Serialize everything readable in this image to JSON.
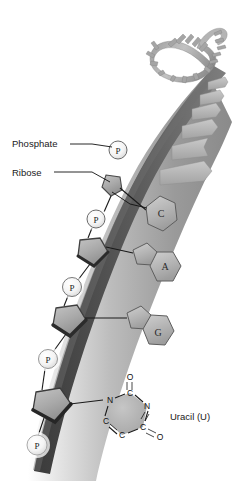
{
  "figure": {
    "background_color": "#ffffff"
  },
  "labels": {
    "phosphate": "Phosphate",
    "ribose": "Ribose",
    "uracil": "Uracil (U)"
  },
  "phosphate_markers": [
    {
      "text": "P",
      "cx": 118,
      "cy": 150,
      "r": 10.5
    },
    {
      "text": "P",
      "cx": 96,
      "cy": 219,
      "r": 10.5
    },
    {
      "text": "P",
      "cx": 72,
      "cy": 287,
      "r": 10.5
    },
    {
      "text": "P",
      "cx": 48,
      "cy": 359,
      "r": 10.5
    },
    {
      "text": "P",
      "cx": 37,
      "cy": 445,
      "r": 10.5
    }
  ],
  "bases": [
    {
      "label": "C",
      "name": "cytosine",
      "shape": "hexagon",
      "cx": 160,
      "cy": 213
    },
    {
      "label": "A",
      "name": "adenine",
      "shape": "purine",
      "cx": 163,
      "cy": 270
    },
    {
      "label": "G",
      "name": "guanine",
      "shape": "purine",
      "cx": 157,
      "cy": 336
    },
    {
      "label": "U",
      "name": "uracil",
      "shape": "pyrimidine-atoms",
      "cx": 131,
      "cy": 412
    }
  ],
  "uracil_atoms": [
    {
      "symbol": "N",
      "x": 110,
      "y": 400
    },
    {
      "symbol": "C",
      "x": 130,
      "y": 393
    },
    {
      "symbol": "N",
      "x": 147,
      "y": 406
    },
    {
      "symbol": "C",
      "x": 143,
      "y": 427
    },
    {
      "symbol": "C",
      "x": 122,
      "y": 435
    },
    {
      "symbol": "C",
      "x": 106,
      "y": 421
    },
    {
      "symbol": "O",
      "x": 130,
      "y": 377
    },
    {
      "symbol": "O",
      "x": 160,
      "y": 437
    }
  ],
  "ribose_rings": [
    {
      "cx": 113,
      "cy": 183
    },
    {
      "cx": 91,
      "cy": 252
    },
    {
      "cx": 67,
      "cy": 321
    },
    {
      "cx": 48,
      "cy": 404
    }
  ],
  "colors": {
    "backbone_dark": "#4d4d4d",
    "backbone_mid": "#8c8c8c",
    "backbone_light": "#d8d8d8",
    "base_fill": "#b9b9b9",
    "base_stroke": "#5a5a5a",
    "phosphate_fill": "#f2f2f2",
    "ribose_fill": "#a8a8a8",
    "text": "#1a1a1a"
  }
}
